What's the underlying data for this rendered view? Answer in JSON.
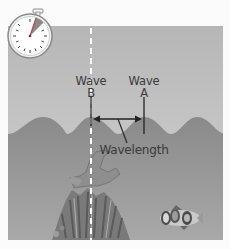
{
  "diagram": {
    "labels": {
      "wave_b_line1": "Wave",
      "wave_b_line2": "B",
      "wave_a_line1": "Wave",
      "wave_a_line2": "A",
      "wavelength": "Wavelength"
    },
    "icons": {
      "stopwatch": "stopwatch-icon",
      "coral": "coral-illustration",
      "fish": "clownfish-illustration"
    },
    "colors": {
      "background": "#fbfbfb",
      "sky_top": "#b8b8b8",
      "sky_bottom": "#d2d2d2",
      "water_top": "#8c8c8c",
      "water_bottom": "#a8a8a8",
      "text": "#3a3a3a",
      "dashed_line": "#ffffff"
    }
  }
}
